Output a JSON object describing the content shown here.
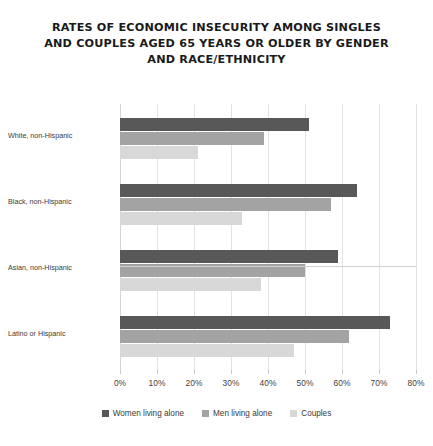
{
  "chart_data": {
    "type": "bar",
    "orientation": "horizontal",
    "title": "RATES OF ECONOMIC INSECURITY AMONG SINGLES AND COUPLES AGED 65 YEARS OR OLDER BY GENDER AND RACE/ETHNICITY",
    "title_lines": [
      "RATES OF ECONOMIC INSECURITY AMONG SINGLES",
      "AND COUPLES AGED 65 YEARS OR OLDER BY GENDER",
      "AND RACE/ETHNICITY"
    ],
    "xlabel": "",
    "ylabel": "",
    "categories": [
      "White, non-Hispanic",
      "Black, non-Hispanic",
      "Asian, non-Hispanic",
      "Latino or Hispanic"
    ],
    "series": [
      {
        "name": "Women living alone",
        "color": "#585858",
        "values": [
          51,
          64,
          59,
          73
        ]
      },
      {
        "name": "Men living alone",
        "color": "#a3a3a3",
        "values": [
          39,
          57,
          50,
          62
        ]
      },
      {
        "name": "Couples",
        "color": "#d8d8d8",
        "values": [
          21,
          33,
          38,
          47
        ]
      }
    ],
    "xlim": [
      0,
      80
    ],
    "xticks": [
      0,
      10,
      20,
      30,
      40,
      50,
      60,
      70,
      80
    ],
    "xtick_labels": [
      "0%",
      "10%",
      "20%",
      "30%",
      "40%",
      "50%",
      "60%",
      "70%",
      "80%"
    ],
    "grid": true,
    "legend_position": "bottom",
    "value_format": "percent"
  }
}
